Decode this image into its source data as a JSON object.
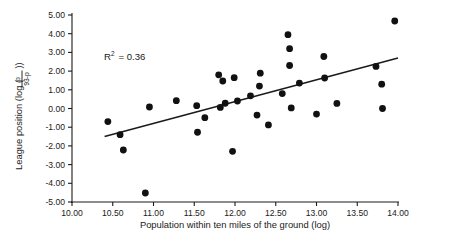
{
  "figure": {
    "background_color": "#ffffff",
    "foreground_color": "#1a1a1a",
    "width": 463,
    "height": 248
  },
  "annotation": {
    "r_squared_prefix": "R",
    "r_squared_exponent": "2",
    "r_squared_equals": "= 0.36",
    "r_squared_full": "R2 = 0.36",
    "value": 0.36
  },
  "axis_titles": {
    "x": "Population within ten miles of the ground (log)",
    "y_prefix": "League position (log (",
    "y_fraction_numerator": "p",
    "y_fraction_denominator": "93-p",
    "y_suffix": "))",
    "y_full": "League position (log (p/(93-p)))"
  },
  "x_axis": {
    "ticks": [
      "10.00",
      "10.50",
      "11.00",
      "11.50",
      "12.00",
      "12.50",
      "13.00",
      "13.50",
      "14.00"
    ],
    "tick_values": [
      10.0,
      10.5,
      11.0,
      11.5,
      12.0,
      12.5,
      13.0,
      13.5,
      14.0
    ],
    "min": 10.0,
    "max": 14.0
  },
  "y_axis": {
    "ticks": [
      "5.00",
      "4.00",
      "3.00",
      "2.00",
      "1.00",
      "0.00",
      "-1.00",
      "-2.00",
      "-3.00",
      "-4.00",
      "-5.00"
    ],
    "tick_values": [
      5,
      4,
      3,
      2,
      1,
      0,
      -1,
      -2,
      -3,
      -4,
      -5
    ],
    "min": -5,
    "max": 5
  },
  "chart_data": {
    "type": "scatter",
    "title": "",
    "subtitle": "",
    "xlabel": "Population within ten miles of the ground (log)",
    "ylabel": "League position (log (p/(93-p)))",
    "xlim": [
      10.0,
      14.0
    ],
    "ylim": [
      -5.0,
      5.0
    ],
    "xticks": [
      10.0,
      10.5,
      11.0,
      11.5,
      12.0,
      12.5,
      13.0,
      13.5,
      14.0
    ],
    "yticks": [
      -5,
      -4,
      -3,
      -2,
      -1,
      0,
      1,
      2,
      3,
      4,
      5
    ],
    "grid": false,
    "legend": false,
    "legend_position": "none",
    "annotations": [
      {
        "text": "R2 = 0.36",
        "x": 10.52,
        "y": 3.05
      }
    ],
    "marker": {
      "shape": "circle",
      "color": "#111111",
      "size": 3.4
    },
    "series": [
      {
        "name": "clubs",
        "points": [
          [
            10.44,
            -0.7
          ],
          [
            10.59,
            -1.4
          ],
          [
            10.63,
            -2.22
          ],
          [
            10.9,
            -4.52
          ],
          [
            10.95,
            0.08
          ],
          [
            11.28,
            0.42
          ],
          [
            11.53,
            0.15
          ],
          [
            11.54,
            -1.27
          ],
          [
            11.63,
            -0.49
          ],
          [
            11.8,
            1.8
          ],
          [
            11.82,
            0.06
          ],
          [
            11.85,
            1.47
          ],
          [
            11.88,
            0.28
          ],
          [
            11.97,
            -2.29
          ],
          [
            11.99,
            1.65
          ],
          [
            12.03,
            0.4
          ],
          [
            12.19,
            0.68
          ],
          [
            12.27,
            -0.35
          ],
          [
            12.3,
            1.2
          ],
          [
            12.31,
            1.89
          ],
          [
            12.41,
            -0.88
          ],
          [
            12.58,
            0.8
          ],
          [
            12.65,
            3.95
          ],
          [
            12.67,
            3.2
          ],
          [
            12.67,
            2.3
          ],
          [
            12.69,
            0.03
          ],
          [
            12.79,
            1.36
          ],
          [
            13.0,
            -0.3
          ],
          [
            13.09,
            2.78
          ],
          [
            13.1,
            1.63
          ],
          [
            13.25,
            0.27
          ],
          [
            13.73,
            2.25
          ],
          [
            13.8,
            1.3
          ],
          [
            13.81,
            0.0
          ],
          [
            13.96,
            4.68
          ]
        ]
      }
    ],
    "fit_line": {
      "name": "linear regression",
      "x_start": 10.4,
      "y_start": -1.5,
      "x_end": 14.0,
      "y_end": 2.7,
      "slope": 1.167,
      "intercept": -13.63,
      "r_squared": 0.36
    }
  }
}
